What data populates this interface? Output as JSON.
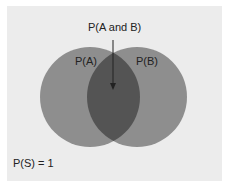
{
  "diagram": {
    "type": "venn",
    "labels": {
      "intersection": "P(A and B)",
      "set_a": "P(A)",
      "set_b": "P(B)",
      "sample_space": "P(S) = 1"
    },
    "colors": {
      "background": "#ececec",
      "circle_fill": "#8e8e8e",
      "intersection_fill": "#545454",
      "arrow": "#222222",
      "text": "#222222"
    }
  }
}
